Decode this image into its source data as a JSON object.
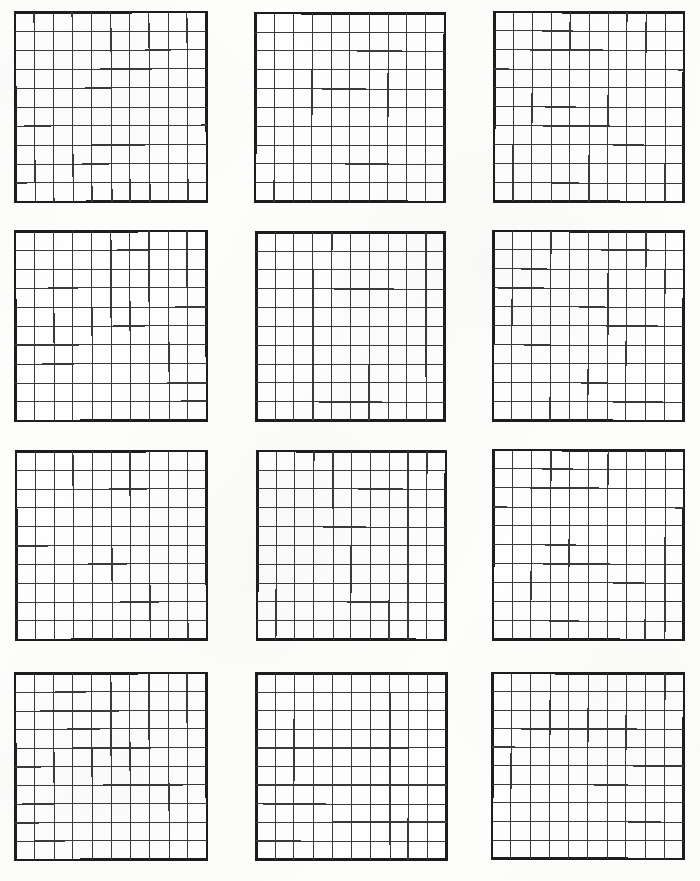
{
  "worksheet": {
    "title": "Hundredths Grids",
    "description": "Blank printable worksheet of twelve empty 10 by 10 hundredths grids",
    "page_width": 700,
    "page_height": 881,
    "background_color": "#fdfdfc",
    "paper_style": "scanned-white-paper",
    "layout": {
      "columns": 3,
      "rows": 4,
      "grid_count": 12
    },
    "grid_spec": {
      "cells_across": 10,
      "cells_down": 10,
      "total_cells": 100,
      "outer_border_color": "#1d1d1d",
      "inner_line_color": "#3a3a3a",
      "cell_fill_color": "#fefefe",
      "outer_border_width": 2.6,
      "inner_line_width": 1.15
    },
    "grids": [
      {
        "id": "grid-r1-c1",
        "row": 1,
        "col": 1,
        "x": 14,
        "y": 11,
        "w": 194,
        "h": 192,
        "rotate": -0.25
      },
      {
        "id": "grid-r1-c2",
        "row": 1,
        "col": 2,
        "x": 254,
        "y": 12,
        "w": 192,
        "h": 191,
        "rotate": 0.1
      },
      {
        "id": "grid-r1-c3",
        "row": 1,
        "col": 3,
        "x": 493,
        "y": 11,
        "w": 192,
        "h": 192,
        "rotate": 0.2
      },
      {
        "id": "grid-r2-c1",
        "row": 2,
        "col": 1,
        "x": 14,
        "y": 230,
        "w": 194,
        "h": 192,
        "rotate": -0.2
      },
      {
        "id": "grid-r2-c2",
        "row": 2,
        "col": 2,
        "x": 255,
        "y": 231,
        "w": 191,
        "h": 191,
        "rotate": 0.05
      },
      {
        "id": "grid-r2-c3",
        "row": 2,
        "col": 3,
        "x": 492,
        "y": 230,
        "w": 193,
        "h": 192,
        "rotate": 0.25
      },
      {
        "id": "grid-r3-c1",
        "row": 3,
        "col": 1,
        "x": 15,
        "y": 450,
        "w": 193,
        "h": 191,
        "rotate": -0.15
      },
      {
        "id": "grid-r3-c2",
        "row": 3,
        "col": 2,
        "x": 256,
        "y": 450,
        "w": 191,
        "h": 191,
        "rotate": 0.1
      },
      {
        "id": "grid-r3-c3",
        "row": 3,
        "col": 3,
        "x": 492,
        "y": 449,
        "w": 193,
        "h": 192,
        "rotate": 0.2
      },
      {
        "id": "grid-r4-c1",
        "row": 4,
        "col": 1,
        "x": 14,
        "y": 672,
        "w": 194,
        "h": 189,
        "rotate": -0.2
      },
      {
        "id": "grid-r4-c2",
        "row": 4,
        "col": 2,
        "x": 255,
        "y": 672,
        "w": 193,
        "h": 189,
        "rotate": 0.05
      },
      {
        "id": "grid-r4-c3",
        "row": 4,
        "col": 3,
        "x": 491,
        "y": 672,
        "w": 194,
        "h": 188,
        "rotate": 0.15
      }
    ]
  }
}
